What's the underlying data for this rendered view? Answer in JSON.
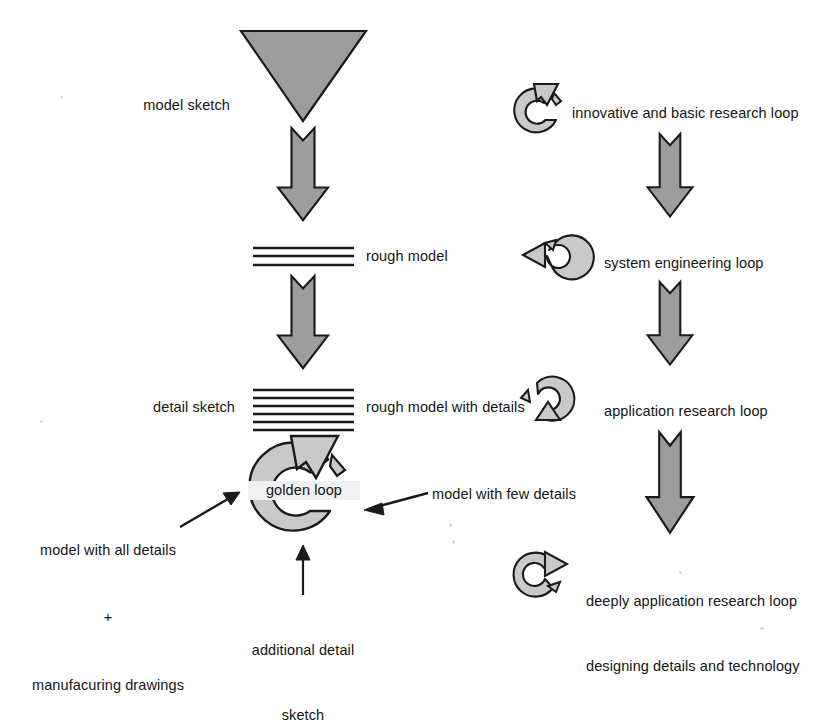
{
  "diagram": {
    "colors": {
      "fill_gray": "#9d9d9d",
      "fill_gray_light": "#b3b3b3",
      "outline": "#1a1a1a",
      "text": "#141414",
      "background": "#ffffff"
    },
    "left_column": {
      "name": "model development flow",
      "nodes": [
        {
          "id": "model-sketch",
          "shape": "down-triangle",
          "label": "model sketch",
          "label_side": "left"
        },
        {
          "id": "rough-model",
          "shape": "line-stack-3",
          "label": "rough model",
          "label_side": "right"
        },
        {
          "id": "rough-model-details",
          "shape": "line-stack-6",
          "label": "rough model with details",
          "label_side": "right",
          "secondary_label": "detail sketch",
          "secondary_side": "left"
        },
        {
          "id": "golden-loop",
          "shape": "circular-arrow",
          "label": "golden loop"
        }
      ],
      "annotations": [
        {
          "id": "model-all-details",
          "lines": [
            "model with all details",
            "+",
            "manufacuring drawings"
          ],
          "arrow": "up-right"
        },
        {
          "id": "model-few-details",
          "lines": [
            "model with few details"
          ],
          "arrow": "left"
        },
        {
          "id": "additional-detail-sketch",
          "lines": [
            "additional detail",
            "sketch"
          ],
          "arrow": "up"
        }
      ]
    },
    "right_column": {
      "name": "research loop flow",
      "loops": [
        {
          "id": "innovative-basic-research",
          "lines": [
            "innovative and basic research loop"
          ],
          "arrow_dir": "up-right"
        },
        {
          "id": "system-engineering",
          "lines": [
            "system engineering loop"
          ],
          "arrow_dir": "left"
        },
        {
          "id": "application-research",
          "lines": [
            "application research loop"
          ],
          "arrow_dir": "down"
        },
        {
          "id": "deeply-application-research",
          "lines": [
            "deeply application research loop",
            "designing details and technology"
          ],
          "arrow_dir": "right"
        }
      ]
    }
  }
}
